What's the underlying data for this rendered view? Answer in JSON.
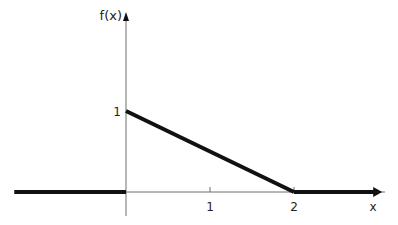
{
  "chart_data": {
    "type": "line",
    "title": "",
    "xlabel": "x",
    "ylabel": "f(x)",
    "xlim": [
      -1.33,
      3.1
    ],
    "ylim": [
      -0.3,
      2.2
    ],
    "x_ticks": [
      {
        "value": 1,
        "label": "1"
      },
      {
        "value": 2,
        "label": "2"
      }
    ],
    "y_ticks": [
      {
        "value": 1,
        "label": "1"
      }
    ],
    "grid": false,
    "legend": "none",
    "series": [
      {
        "name": "f(x)",
        "segments": [
          {
            "points": [
              [
                -1.33,
                0
              ],
              [
                0,
                0
              ]
            ],
            "extends": "left"
          },
          {
            "points": [
              [
                0,
                1
              ],
              [
                2,
                0
              ]
            ]
          },
          {
            "points": [
              [
                2,
                0
              ],
              [
                3.05,
                0
              ]
            ],
            "extends": "right",
            "arrow": true
          }
        ]
      }
    ]
  },
  "colors": {
    "axis": "#6e6e6e",
    "curve": "#111111",
    "text": "#222222"
  }
}
